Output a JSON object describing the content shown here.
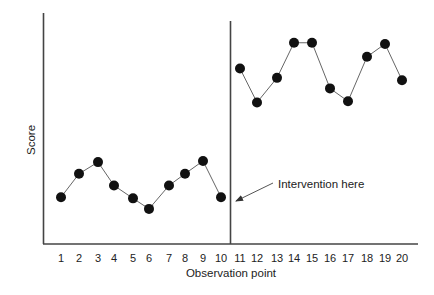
{
  "chart_data": {
    "type": "line",
    "title": "",
    "xlabel": "Observation point",
    "ylabel": "Score",
    "x": [
      1,
      2,
      3,
      4,
      5,
      6,
      7,
      8,
      9,
      10,
      11,
      12,
      13,
      14,
      15,
      16,
      17,
      18,
      19,
      20
    ],
    "tick_labels": [
      "1",
      "2",
      "3",
      "4",
      "5",
      "6",
      "7",
      "8",
      "9",
      "10",
      "11",
      "12",
      "13",
      "14",
      "15",
      "16",
      "17",
      "18",
      "19",
      "20"
    ],
    "series": [
      {
        "name": "Score",
        "values": [
          4.0,
          6.0,
          7.0,
          5.0,
          3.9,
          3.0,
          5.0,
          6.0,
          7.1,
          4.0,
          15.0,
          12.1,
          14.2,
          17.2,
          17.2,
          13.3,
          12.2,
          16.0,
          17.1,
          14.0
        ]
      }
    ],
    "ylim": [
      0,
      20
    ],
    "y_ticks_shown": false,
    "grid": false,
    "legend": null,
    "phase_line": {
      "between": [
        10,
        11
      ],
      "label": "Intervention here"
    },
    "annotations": [
      {
        "text": "Intervention here",
        "points_to": "phase change line between observation 10 and 11"
      }
    ]
  },
  "labels": {
    "xlabel": "Observation point",
    "ylabel": "Score",
    "annotation": "Intervention here"
  }
}
